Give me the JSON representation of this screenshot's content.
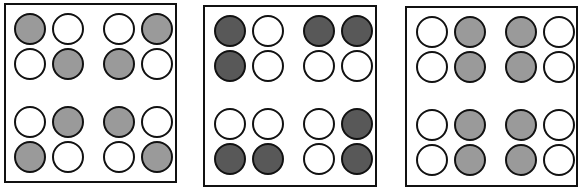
{
  "colors": {
    "empty": "#ffffff",
    "light": "#9a9a9a",
    "dark": "#585858",
    "border": "#111111"
  },
  "panels": [
    {
      "name": "panel-1",
      "box": {
        "left": 4,
        "top": 3,
        "width": 173,
        "height": 180
      },
      "circle_origin": {
        "x": 10,
        "y": 10
      },
      "grid": [
        [
          "light",
          "empty",
          "empty",
          "light"
        ],
        [
          "empty",
          "light",
          "light",
          "empty"
        ],
        [
          "empty",
          "light",
          "light",
          "empty"
        ],
        [
          "light",
          "empty",
          "empty",
          "light"
        ]
      ]
    },
    {
      "name": "panel-2",
      "box": {
        "left": 203,
        "top": 5,
        "width": 174,
        "height": 182
      },
      "circle_origin": {
        "x": 11,
        "y": 10
      },
      "grid": [
        [
          "dark",
          "empty",
          "dark",
          "dark"
        ],
        [
          "dark",
          "empty",
          "empty",
          "empty"
        ],
        [
          "empty",
          "empty",
          "empty",
          "dark"
        ],
        [
          "dark",
          "dark",
          "empty",
          "dark"
        ]
      ]
    },
    {
      "name": "panel-3",
      "box": {
        "left": 405,
        "top": 6,
        "width": 173,
        "height": 181
      },
      "circle_origin": {
        "x": 11,
        "y": 10
      },
      "grid": [
        [
          "empty",
          "light",
          "light",
          "empty"
        ],
        [
          "empty",
          "light",
          "light",
          "empty"
        ],
        [
          "empty",
          "light",
          "light",
          "empty"
        ],
        [
          "empty",
          "light",
          "light",
          "empty"
        ]
      ]
    }
  ]
}
